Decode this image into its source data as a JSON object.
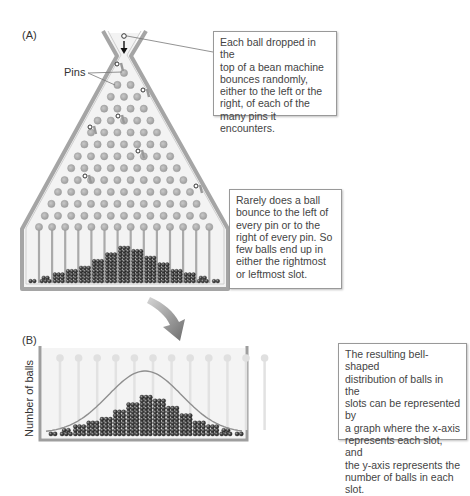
{
  "panel_a": {
    "label": "(A)",
    "pins_label": "Pins",
    "callout_top": "Each ball dropped in the top of a bean machine bounces randomly, either to the left or the right, of each of the many pins it encounters.",
    "callout_top_lines": [
      "Each ball dropped in the",
      "top of a bean machine",
      "bounces randomly,",
      "either to the left or the",
      "right, of each of the",
      "many pins it encounters."
    ],
    "callout_bottom_lines": [
      "Rarely does a ball",
      "bounce to the left of",
      "every pin or to the",
      "right of every pin. So",
      "few balls end up in",
      "either the rightmost",
      "or leftmost slot."
    ],
    "pin_rows": 13,
    "slot_ball_rows": [
      1,
      2,
      3,
      4,
      5,
      7,
      9,
      11,
      10,
      8,
      6,
      4,
      3,
      2,
      1
    ]
  },
  "panel_b": {
    "label": "(B)",
    "ylabel": "Number of balls",
    "callout_lines": [
      "The resulting bell-shaped",
      "distribution of balls in the",
      "slots can be represented by",
      "a graph where the x-axis",
      "represents each slot, and",
      "the y-axis represents the",
      "number of balls in each slot."
    ],
    "slot_ball_rows": [
      1,
      2,
      3,
      4,
      5,
      7,
      9,
      11,
      10,
      8,
      6,
      4,
      3,
      2,
      1
    ]
  },
  "colors": {
    "frame": "#a9a9a9",
    "frame_dark": "#8c8c8c",
    "pin": "#b5b5b5",
    "ball": "#3a3a3a",
    "curve": "#8f8f8f",
    "arrow": "#777777"
  }
}
